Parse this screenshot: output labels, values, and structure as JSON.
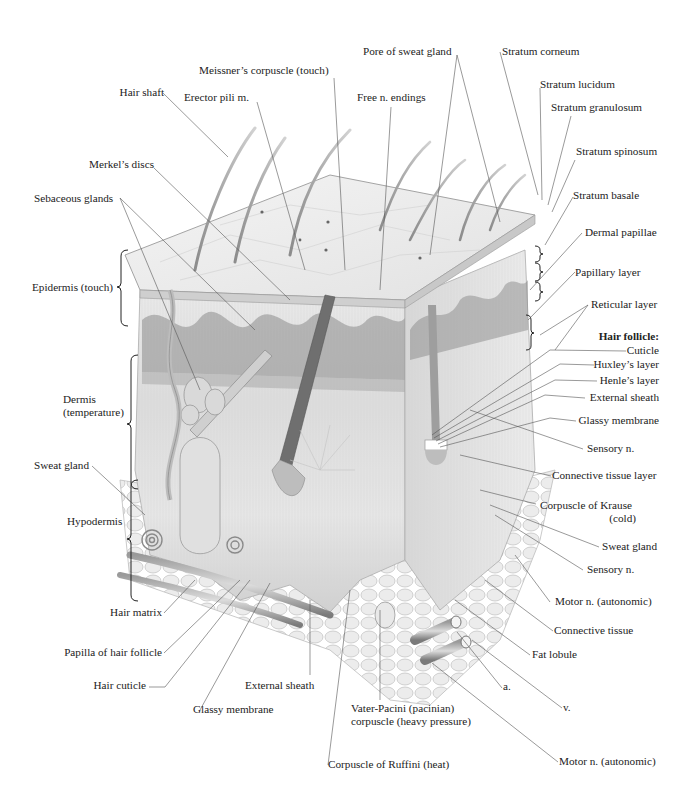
{
  "diagram": {
    "colors": {
      "background": "#ffffff",
      "ink": "#222222",
      "leader": "#555555",
      "tissue_light": "#eeeeee",
      "tissue_mid": "#bdbdbd",
      "tissue_dark": "#6f6f6f"
    },
    "labels_top": {
      "hair_shaft": "Hair shaft",
      "erector_pili": "Erector pili m.",
      "meissner": "Meissner’s corpuscle (touch)",
      "free_endings": "Free n. endings",
      "pore_sweat_gland": "Pore of sweat gland",
      "stratum_corneum": "Stratum corneum",
      "stratum_lucidum": "Stratum lucidum",
      "stratum_granulosum": "Stratum granulosum",
      "stratum_spinosum": "Stratum spinosum",
      "stratum_basale": "Stratum basale"
    },
    "labels_left": {
      "merkels_discs": "Merkel’s discs",
      "sebaceous_glands": "Sebaceous glands",
      "epidermis": "Epidermis (touch)",
      "dermis_line1": "Dermis",
      "dermis_line2": "(temperature)",
      "sweat_gland": "Sweat gland",
      "hypodermis": "Hypodermis"
    },
    "labels_right": {
      "dermal_papillae": "Dermal papillae",
      "papillary_layer": "Papillary layer",
      "reticular_layer": "Reticular layer",
      "hair_follicle_heading": "Hair follicle:",
      "cuticle": "Cuticle",
      "huxleys_layer": "Huxley’s layer",
      "henles_layer": "Henle’s layer",
      "external_sheath": "External sheath",
      "glassy_membrane": "Glassy membrane",
      "sensory_n_1": "Sensory n.",
      "connective_tissue_layer": "Connective tissue layer",
      "krause_line1": "Corpuscle of Krause",
      "krause_line2": "(cold)",
      "sweat_gland_right": "Sweat gland",
      "sensory_n_2": "Sensory n.",
      "motor_n_1": "Motor n. (autonomic)",
      "connective_tissue": "Connective tissue",
      "fat_lobule": "Fat lobule",
      "artery": "a.",
      "vein": "v."
    },
    "labels_bottom": {
      "hair_matrix": "Hair matrix",
      "papilla_hair_follicle": "Papilla of hair follicle",
      "hair_cuticle": "Hair cuticle",
      "glassy_membrane_bottom": "Glassy membrane",
      "external_sheath_bottom": "External sheath",
      "pacini_line1": "Vater-Pacini (pacinian)",
      "pacini_line2": "corpuscle (heavy pressure)",
      "ruffini": "Corpuscle of Ruffini (heat)",
      "motor_n_2": "Motor n. (autonomic)"
    }
  }
}
